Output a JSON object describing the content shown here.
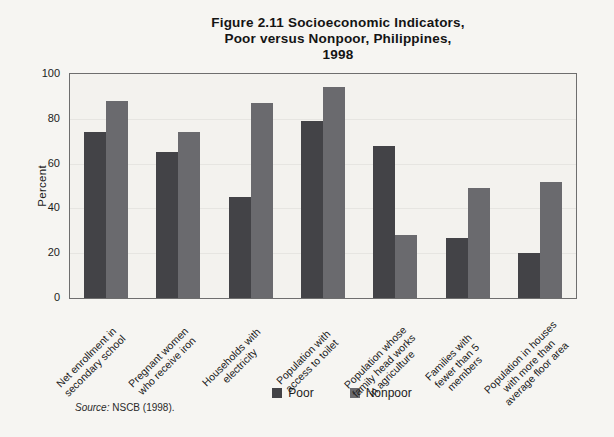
{
  "figure": {
    "title_display": "Figure 2.11 Socioeconomic Indicators,\nPoor versus Nonpoor, Philippines,\n1998",
    "source_prefix": "Source:",
    "source_text": "NSCB (1998)."
  },
  "chart_data": {
    "type": "bar",
    "title": "Figure 2.11 Socioeconomic Indicators, Poor versus Nonpoor, Philippines, 1998",
    "xlabel": "",
    "ylabel": "Percent",
    "ylim": [
      0,
      100
    ],
    "yticks": [
      0,
      20,
      40,
      60,
      80,
      100
    ],
    "grid": true,
    "gridlines": [
      20,
      40,
      60,
      80
    ],
    "legend_position": "bottom",
    "categories": [
      "Net enrollment in\nsecondary school",
      "Pregnant women\nwho receive iron",
      "Households with\nelectricity",
      "Population with\naccess to toilet",
      "Population whose\nfamily head works\nin agriculture",
      "Families with\nfewer than 5\nmembers",
      "Population in houses\nwith more than\naverage floor area"
    ],
    "series": [
      {
        "name": "Poor",
        "color": "#434347",
        "values": [
          74,
          65,
          45,
          79,
          68,
          27,
          20
        ]
      },
      {
        "name": "Nonpoor",
        "color": "#6a6a6e",
        "values": [
          88,
          74,
          87,
          94,
          28,
          49,
          52
        ]
      }
    ],
    "source": "Source: NSCB (1998)."
  },
  "colors": {
    "page_bg": "#f6f5f2",
    "plot_bg": "#f3f2ee",
    "plot_border": "#6e6e6e",
    "gridline": "#e6e5e1",
    "text": "#1a1a1a"
  }
}
